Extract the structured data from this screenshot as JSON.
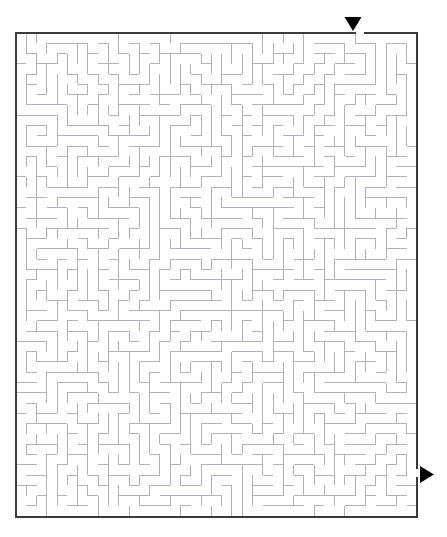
{
  "page": {
    "width": 447,
    "height": 537,
    "background_color": "#ffffff",
    "title_partial": "",
    "kind": "printable-maze-puzzle"
  },
  "maze": {
    "label": "maze-puzzle",
    "columns": 39,
    "rows": 47,
    "cell_size": 10.28,
    "origin_x": 16,
    "origin_y": 33,
    "width": 401,
    "height": 484,
    "border_color": "#3a3a3a",
    "border_width": 2,
    "wall_color": "#b2b2b8",
    "wall_width": 1,
    "background_color": "#ffffff",
    "entrance": {
      "label": "entrance",
      "side": "top",
      "column": 33,
      "gap_x": 355,
      "gap_width": 10,
      "arrow_glyph": "▼",
      "arrow_color": "#000000",
      "arrow_x": 353,
      "arrow_y": 17,
      "arrow_size": 17
    },
    "exit": {
      "label": "exit",
      "side": "right",
      "row": 42,
      "gap_y": 468,
      "gap_height": 10,
      "arrow_glyph": "▶",
      "arrow_color": "#000000",
      "arrow_x": 420,
      "arrow_y": 466,
      "arrow_size": 17
    },
    "seed": 20240517
  }
}
